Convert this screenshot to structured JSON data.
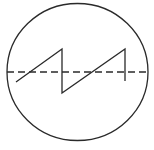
{
  "diagram": {
    "type": "symbol",
    "stroke_color": "#2a2a2a",
    "background": "#ffffff",
    "circle": {
      "cx": 77.5,
      "cy": 72,
      "rx": 70.5,
      "ry": 68.5
    },
    "axis": {
      "x1": 7,
      "y1": 72,
      "x2": 148,
      "y2": 72,
      "dash": "7 4"
    },
    "waveform": {
      "shape": "sawtooth",
      "points": [
        [
          16,
          82
        ],
        [
          62,
          49
        ],
        [
          62,
          93
        ],
        [
          125,
          49
        ],
        [
          125,
          81
        ]
      ]
    }
  }
}
